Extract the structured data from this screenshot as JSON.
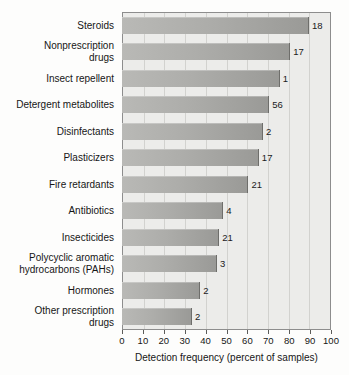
{
  "chart_data": {
    "type": "bar",
    "orientation": "horizontal",
    "title": "",
    "xlabel": "Detection frequency (percent of samples)",
    "ylabel": "",
    "xlim": [
      0,
      100
    ],
    "xticks": [
      0,
      10,
      20,
      30,
      40,
      50,
      60,
      70,
      80,
      90,
      100
    ],
    "grid": true,
    "legend": null,
    "categories": [
      "Steroids",
      "Nonprescription drugs",
      "Insect repellent",
      "Detergent metabolites",
      "Disinfectants",
      "Plasticizers",
      "Fire retardants",
      "Antibiotics",
      "Insecticides",
      "Polycyclic aromatic hydrocarbons (PAHs)",
      "Hormones",
      "Other prescription drugs"
    ],
    "values": [
      89,
      80,
      75,
      70,
      67,
      65,
      60,
      48,
      46,
      45,
      37,
      33
    ],
    "annotations": [
      "18",
      "17",
      "1",
      "56",
      "2",
      "17",
      "21",
      "4",
      "21",
      "3",
      "2",
      "2"
    ]
  },
  "axis": {
    "x_title": "Detection frequency (percent of samples)",
    "tick_labels": [
      "0",
      "10",
      "20",
      "30",
      "40",
      "50",
      "60",
      "70",
      "80",
      "90",
      "100"
    ]
  },
  "rows": [
    {
      "label_lines": [
        "Steroids"
      ],
      "value": 89,
      "annotation": "18"
    },
    {
      "label_lines": [
        "Nonprescription",
        "drugs"
      ],
      "value": 80,
      "annotation": "17"
    },
    {
      "label_lines": [
        "Insect repellent"
      ],
      "value": 75,
      "annotation": "1"
    },
    {
      "label_lines": [
        "Detergent metabolites"
      ],
      "value": 70,
      "annotation": "56"
    },
    {
      "label_lines": [
        "Disinfectants"
      ],
      "value": 67,
      "annotation": "2"
    },
    {
      "label_lines": [
        "Plasticizers"
      ],
      "value": 65,
      "annotation": "17"
    },
    {
      "label_lines": [
        "Fire retardants"
      ],
      "value": 60,
      "annotation": "21"
    },
    {
      "label_lines": [
        "Antibiotics"
      ],
      "value": 48,
      "annotation": "4"
    },
    {
      "label_lines": [
        "Insecticides"
      ],
      "value": 46,
      "annotation": "21"
    },
    {
      "label_lines": [
        "Polycyclic aromatic",
        "hydrocarbons (PAHs)"
      ],
      "value": 45,
      "annotation": "3"
    },
    {
      "label_lines": [
        "Hormones"
      ],
      "value": 37,
      "annotation": "2"
    },
    {
      "label_lines": [
        "Other prescription",
        "drugs"
      ],
      "value": 33,
      "annotation": "2"
    }
  ],
  "colors": {
    "bar_light": "#b9b9b6",
    "bar_dark": "#9a9a97",
    "plot_background": "#ececea",
    "frame": "#8d8d8d",
    "gridline": "#d2d2cf",
    "text": "#161616"
  }
}
